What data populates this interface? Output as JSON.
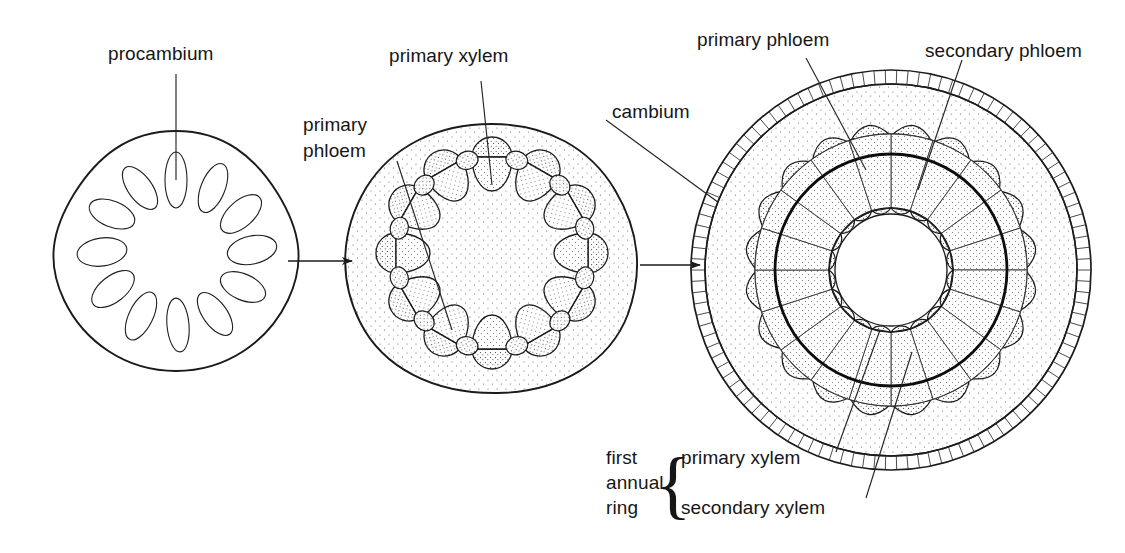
{
  "figure": {
    "background_color": "#ffffff",
    "ink_color": "#1b1b1b",
    "stipple_color": "#555555"
  },
  "labels": {
    "procambium": "procambium",
    "primary_xylem_mid": "primary xylem",
    "primary_phloem_mid_line1": "primary",
    "primary_phloem_mid_line2": "phloem",
    "cambium": "cambium",
    "primary_phloem_right": "primary phloem",
    "secondary_phloem_right": "secondary phloem",
    "first_annual_ring_line1": "first",
    "first_annual_ring_line2": "annual",
    "first_annual_ring_line3": "ring",
    "brace_glyph": "{",
    "primary_xylem_right": "primary xylem",
    "secondary_xylem_right": "secondary xylem"
  },
  "stages": [
    {
      "id": "stage-1",
      "name": "procambium-stage",
      "outline_shape": "rounded-diamond",
      "center": [
        176,
        250
      ],
      "bundle_count": 12,
      "bundle_shape": "oval",
      "ring_radius": 73,
      "description": "Young stem cross-section with a ring of twelve oval procambium strands."
    },
    {
      "id": "stage-2",
      "name": "primary-growth-stage",
      "outline_shape": "rounded-blob",
      "center": [
        492,
        253
      ],
      "ring_radius": 96,
      "large_bundle_count": 12,
      "small_bundle_count": 12,
      "description": "Stem with alternating large and small vascular bundles on the cambium ring; phloem outside, xylem inside."
    },
    {
      "id": "stage-3",
      "name": "secondary-growth-stage",
      "outline_shape": "circle",
      "center": [
        891,
        270
      ],
      "epidermis_outer_radius": 200,
      "epidermis_inner_radius": 186,
      "cortex_radius": 186,
      "primary_phloem_radius": 136,
      "cambium_radius": 116,
      "secondary_xylem_outer_radius": 116,
      "primary_xylem_radius": 62,
      "pith_radius": 56,
      "wedge_count": 20,
      "primary_xylem_lobe_count": 20,
      "description": "Woody stem after one year: pith, primary xylem lobes, radial secondary xylem wedges, cambium ring, secondary phloem wedges, primary phloem caps, cortex and epidermis."
    }
  ],
  "arrows": [
    {
      "name": "arrow-stage1-to-stage2",
      "from": [
        288,
        261
      ],
      "to": [
        352,
        261
      ]
    },
    {
      "name": "arrow-stage2-to-stage3",
      "from": [
        640,
        265
      ],
      "to": [
        700,
        265
      ]
    }
  ],
  "colors": {
    "ink": "#1b1b1b",
    "cambium": "#0d0d0d",
    "stipple": "#555555",
    "paper": "#ffffff"
  }
}
